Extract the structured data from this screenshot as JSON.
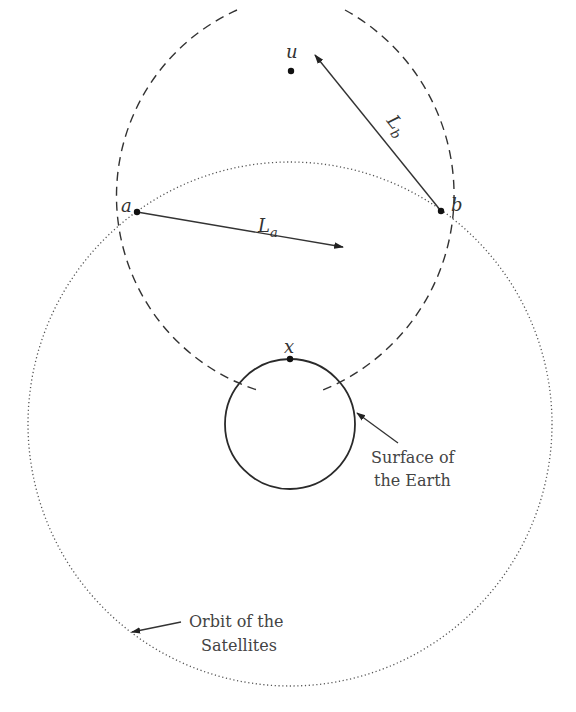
{
  "diagram": {
    "points": {
      "u": {
        "label": "u",
        "x": 291,
        "y": 71
      },
      "a": {
        "label": "a",
        "x": 137,
        "y": 212
      },
      "b": {
        "label": "b",
        "x": 441,
        "y": 211
      },
      "x": {
        "label": "x",
        "x": 290,
        "y": 359
      }
    },
    "distances": {
      "La": {
        "symbol": "L",
        "subscript": "a"
      },
      "Lb": {
        "symbol": "L",
        "subscript": "b"
      }
    },
    "annotations": {
      "earth": {
        "line1": "Surface of",
        "line2": "the Earth"
      },
      "orbit": {
        "line1": "Orbit of the",
        "line2": "Satellites"
      }
    },
    "shapes": {
      "orbit_circle": {
        "cx": 290,
        "cy": 424,
        "r": 262,
        "style": "dotted"
      },
      "earth_circle": {
        "cx": 290,
        "cy": 424,
        "r": 65,
        "style": "solid"
      }
    },
    "colors": {
      "line": "#333333",
      "dotted": "#555555",
      "text": "#444444"
    }
  }
}
